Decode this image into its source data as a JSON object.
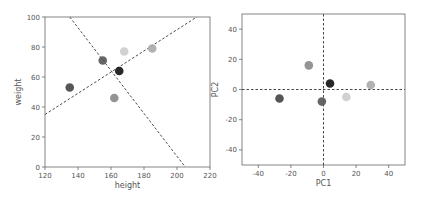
{
  "chart_data": [
    {
      "type": "scatter",
      "title": "",
      "xlabel": "height",
      "ylabel": "weight",
      "xlim": [
        120,
        220
      ],
      "ylim": [
        0,
        100
      ],
      "xticks": [
        120,
        140,
        160,
        180,
        200,
        220
      ],
      "yticks": [
        0,
        20,
        40,
        60,
        80,
        100
      ],
      "grid": false,
      "points": [
        {
          "x": 135,
          "y": 53,
          "color": "#444444"
        },
        {
          "x": 155,
          "y": 71,
          "color": "#555555"
        },
        {
          "x": 162,
          "y": 46,
          "color": "#888888"
        },
        {
          "x": 165,
          "y": 64,
          "color": "#111111"
        },
        {
          "x": 168,
          "y": 77,
          "color": "#cccccc"
        },
        {
          "x": 185,
          "y": 79,
          "color": "#aaaaaa"
        }
      ],
      "lines": [
        {
          "x1": 120,
          "y1": 35,
          "x2": 212,
          "y2": 100,
          "style": "dashed",
          "label": "principal axis 1"
        },
        {
          "x1": 135,
          "y1": 100,
          "x2": 205,
          "y2": 0,
          "style": "dashed",
          "label": "principal axis 2"
        }
      ]
    },
    {
      "type": "scatter",
      "title": "",
      "xlabel": "PC1",
      "ylabel": "PC2",
      "xlim": [
        -50,
        50
      ],
      "ylim": [
        -50,
        50
      ],
      "xticks": [
        -40,
        -20,
        0,
        20,
        40
      ],
      "yticks": [
        -40,
        -20,
        0,
        20,
        40
      ],
      "grid": false,
      "points": [
        {
          "x": -27,
          "y": -6,
          "color": "#444444"
        },
        {
          "x": -9,
          "y": 16,
          "color": "#888888"
        },
        {
          "x": -1,
          "y": -8,
          "color": "#555555"
        },
        {
          "x": 4,
          "y": 4,
          "color": "#111111"
        },
        {
          "x": 14,
          "y": -5,
          "color": "#cccccc"
        },
        {
          "x": 29,
          "y": 3,
          "color": "#aaaaaa"
        }
      ],
      "lines": [
        {
          "x1": -50,
          "y1": 0,
          "x2": 50,
          "y2": 0,
          "style": "dashed",
          "label": "PC1 axis"
        },
        {
          "x1": 0,
          "y1": -50,
          "x2": 0,
          "y2": 50,
          "style": "dashed",
          "label": "PC2 axis"
        }
      ]
    }
  ]
}
